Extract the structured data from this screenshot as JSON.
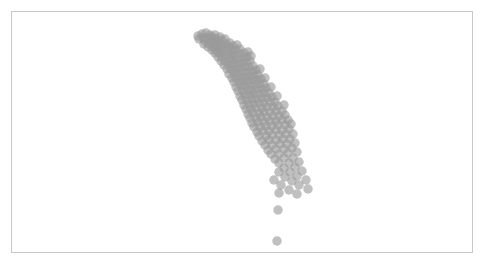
{
  "figure": {
    "width": 485,
    "height": 274,
    "background_color": "#ffffff",
    "frame": {
      "visible": true,
      "color": "#c8c8c8",
      "line_width": 1,
      "left": 11,
      "top": 11,
      "width": 462,
      "height": 242
    }
  },
  "chart_data": {
    "type": "scatter",
    "title": "",
    "subtitle": "",
    "xlabel": "",
    "ylabel": "",
    "grid": false,
    "legend": null,
    "legend_position": "none",
    "annotations": [],
    "xtick_labels": [],
    "ytick_labels": [],
    "axes_visible": false,
    "xlim": [
      0,
      462
    ],
    "ylim": [
      242,
      0
    ],
    "marker": {
      "shape": "circle",
      "diameter_px": 9.5,
      "fill_color": "#9a9a9a",
      "opacity": 0.62,
      "edge_color": "none"
    },
    "series": [
      {
        "name": "points",
        "color": "#9a9a9a",
        "points": [
          [
            186,
            24
          ],
          [
            190,
            22
          ],
          [
            194,
            21
          ],
          [
            198,
            23
          ],
          [
            191,
            26
          ],
          [
            196,
            26
          ],
          [
            200,
            25
          ],
          [
            203,
            23
          ],
          [
            187,
            27
          ],
          [
            193,
            29
          ],
          [
            199,
            29
          ],
          [
            204,
            27
          ],
          [
            208,
            25
          ],
          [
            192,
            32
          ],
          [
            197,
            32
          ],
          [
            202,
            31
          ],
          [
            206,
            30
          ],
          [
            210,
            28
          ],
          [
            213,
            27
          ],
          [
            196,
            35
          ],
          [
            201,
            35
          ],
          [
            205,
            34
          ],
          [
            209,
            33
          ],
          [
            214,
            32
          ],
          [
            218,
            31
          ],
          [
            200,
            38
          ],
          [
            204,
            38
          ],
          [
            208,
            37
          ],
          [
            212,
            36
          ],
          [
            217,
            35
          ],
          [
            221,
            34
          ],
          [
            225,
            33
          ],
          [
            203,
            41
          ],
          [
            207,
            41
          ],
          [
            211,
            40
          ],
          [
            216,
            40
          ],
          [
            220,
            39
          ],
          [
            224,
            38
          ],
          [
            228,
            37
          ],
          [
            206,
            45
          ],
          [
            210,
            45
          ],
          [
            215,
            44
          ],
          [
            219,
            43
          ],
          [
            223,
            43
          ],
          [
            228,
            42
          ],
          [
            232,
            41
          ],
          [
            236,
            40
          ],
          [
            209,
            49
          ],
          [
            213,
            49
          ],
          [
            218,
            48
          ],
          [
            222,
            48
          ],
          [
            226,
            47
          ],
          [
            231,
            46
          ],
          [
            235,
            45
          ],
          [
            239,
            44
          ],
          [
            212,
            53
          ],
          [
            217,
            53
          ],
          [
            221,
            52
          ],
          [
            226,
            52
          ],
          [
            230,
            51
          ],
          [
            234,
            50
          ],
          [
            238,
            49
          ],
          [
            215,
            57
          ],
          [
            219,
            57
          ],
          [
            224,
            57
          ],
          [
            228,
            56
          ],
          [
            233,
            55
          ],
          [
            237,
            55
          ],
          [
            241,
            54
          ],
          [
            217,
            62
          ],
          [
            222,
            61
          ],
          [
            226,
            61
          ],
          [
            231,
            60
          ],
          [
            235,
            60
          ],
          [
            240,
            59
          ],
          [
            244,
            58
          ],
          [
            248,
            57
          ],
          [
            220,
            66
          ],
          [
            224,
            66
          ],
          [
            229,
            65
          ],
          [
            233,
            65
          ],
          [
            238,
            64
          ],
          [
            242,
            64
          ],
          [
            246,
            63
          ],
          [
            222,
            70
          ],
          [
            227,
            70
          ],
          [
            231,
            69
          ],
          [
            236,
            69
          ],
          [
            240,
            68
          ],
          [
            245,
            68
          ],
          [
            249,
            67
          ],
          [
            253,
            66
          ],
          [
            224,
            75
          ],
          [
            229,
            74
          ],
          [
            233,
            74
          ],
          [
            238,
            73
          ],
          [
            243,
            73
          ],
          [
            247,
            72
          ],
          [
            252,
            72
          ],
          [
            226,
            79
          ],
          [
            231,
            79
          ],
          [
            236,
            78
          ],
          [
            240,
            78
          ],
          [
            245,
            77
          ],
          [
            250,
            77
          ],
          [
            254,
            76
          ],
          [
            259,
            75
          ],
          [
            228,
            84
          ],
          [
            233,
            83
          ],
          [
            238,
            83
          ],
          [
            242,
            82
          ],
          [
            247,
            82
          ],
          [
            252,
            81
          ],
          [
            257,
            81
          ],
          [
            230,
            88
          ],
          [
            235,
            88
          ],
          [
            240,
            87
          ],
          [
            245,
            87
          ],
          [
            250,
            86
          ],
          [
            255,
            86
          ],
          [
            260,
            85
          ],
          [
            265,
            84
          ],
          [
            232,
            93
          ],
          [
            237,
            92
          ],
          [
            242,
            92
          ],
          [
            247,
            91
          ],
          [
            252,
            91
          ],
          [
            258,
            90
          ],
          [
            263,
            90
          ],
          [
            234,
            97
          ],
          [
            239,
            97
          ],
          [
            244,
            96
          ],
          [
            250,
            96
          ],
          [
            255,
            95
          ],
          [
            261,
            95
          ],
          [
            266,
            94
          ],
          [
            272,
            93
          ],
          [
            236,
            102
          ],
          [
            241,
            101
          ],
          [
            247,
            101
          ],
          [
            252,
            100
          ],
          [
            258,
            100
          ],
          [
            264,
            99
          ],
          [
            270,
            99
          ],
          [
            238,
            106
          ],
          [
            244,
            106
          ],
          [
            249,
            105
          ],
          [
            255,
            105
          ],
          [
            261,
            104
          ],
          [
            267,
            104
          ],
          [
            273,
            103
          ],
          [
            240,
            111
          ],
          [
            246,
            110
          ],
          [
            252,
            110
          ],
          [
            258,
            109
          ],
          [
            264,
            109
          ],
          [
            270,
            108
          ],
          [
            276,
            108
          ],
          [
            242,
            115
          ],
          [
            248,
            115
          ],
          [
            254,
            114
          ],
          [
            260,
            114
          ],
          [
            266,
            113
          ],
          [
            273,
            113
          ],
          [
            279,
            112
          ],
          [
            245,
            120
          ],
          [
            251,
            119
          ],
          [
            257,
            119
          ],
          [
            264,
            118
          ],
          [
            270,
            118
          ],
          [
            277,
            117
          ],
          [
            247,
            124
          ],
          [
            254,
            124
          ],
          [
            260,
            123
          ],
          [
            267,
            123
          ],
          [
            274,
            122
          ],
          [
            281,
            122
          ],
          [
            250,
            129
          ],
          [
            257,
            128
          ],
          [
            264,
            128
          ],
          [
            271,
            127
          ],
          [
            278,
            127
          ],
          [
            253,
            133
          ],
          [
            260,
            133
          ],
          [
            268,
            132
          ],
          [
            275,
            132
          ],
          [
            283,
            131
          ],
          [
            256,
            138
          ],
          [
            264,
            137
          ],
          [
            272,
            137
          ],
          [
            280,
            136
          ],
          [
            259,
            142
          ],
          [
            267,
            142
          ],
          [
            276,
            141
          ],
          [
            285,
            140
          ],
          [
            263,
            147
          ],
          [
            272,
            146
          ],
          [
            281,
            146
          ],
          [
            267,
            151
          ],
          [
            277,
            151
          ],
          [
            287,
            150
          ],
          [
            272,
            156
          ],
          [
            283,
            155
          ],
          [
            267,
            160
          ],
          [
            278,
            160
          ],
          [
            290,
            159
          ],
          [
            273,
            165
          ],
          [
            285,
            164
          ],
          [
            262,
            168
          ],
          [
            280,
            169
          ],
          [
            294,
            168
          ],
          [
            269,
            173
          ],
          [
            287,
            173
          ],
          [
            277,
            178
          ],
          [
            296,
            177
          ],
          [
            267,
            181
          ],
          [
            285,
            182
          ],
          [
            266,
            198
          ],
          [
            265,
            229
          ]
        ]
      }
    ],
    "point_count": 211,
    "density_note": "dense dark overlap at upper-left of band, sparse light points toward lower-right"
  }
}
